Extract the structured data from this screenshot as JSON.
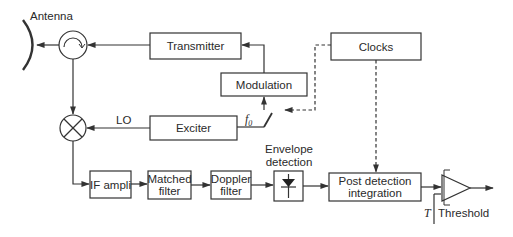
{
  "diagram": {
    "type": "block-diagram",
    "labels": {
      "antenna": "Antenna",
      "lo": "LO",
      "f0_base": "f",
      "f0_sub": "0",
      "envelope_line1": "Envelope",
      "envelope_line2": "detection",
      "threshold_T": "T",
      "threshold": "Threshold"
    },
    "blocks": {
      "transmitter": "Transmitter",
      "modulation": "Modulation",
      "clocks": "Clocks",
      "exciter": "Exciter",
      "if_ampli": "IF ampli",
      "matched_filter_1": "Matched",
      "matched_filter_2": "filter",
      "doppler_filter_1": "Doppler",
      "doppler_filter_2": "filter",
      "post_detection_1": "Post detection",
      "post_detection_2": "integration"
    },
    "nodes": [
      "Antenna",
      "Circulator",
      "Transmitter",
      "Modulation",
      "Clocks",
      "Switch f0",
      "Exciter",
      "Mixer",
      "IF ampli",
      "Matched filter",
      "Doppler filter",
      "Envelope detection",
      "Post detection integration",
      "Threshold comparator"
    ],
    "edges": [
      {
        "from": "Transmitter",
        "to": "Circulator",
        "style": "solid"
      },
      {
        "from": "Circulator",
        "to": "Antenna",
        "style": "solid"
      },
      {
        "from": "Modulation",
        "to": "Transmitter",
        "style": "solid"
      },
      {
        "from": "Clocks",
        "to": "Switch f0",
        "style": "dashed"
      },
      {
        "from": "Switch f0",
        "to": "Modulation",
        "style": "solid"
      },
      {
        "from": "Exciter",
        "to": "Switch f0",
        "style": "solid",
        "label": "f0"
      },
      {
        "from": "Exciter",
        "to": "Mixer",
        "style": "solid",
        "label": "LO"
      },
      {
        "from": "Circulator",
        "to": "Mixer",
        "style": "solid"
      },
      {
        "from": "Mixer",
        "to": "IF ampli",
        "style": "solid"
      },
      {
        "from": "IF ampli",
        "to": "Matched filter",
        "style": "solid"
      },
      {
        "from": "Matched filter",
        "to": "Doppler filter",
        "style": "solid"
      },
      {
        "from": "Doppler filter",
        "to": "Envelope detection",
        "style": "solid"
      },
      {
        "from": "Envelope detection",
        "to": "Post detection integration",
        "style": "solid"
      },
      {
        "from": "Clocks",
        "to": "Post detection integration",
        "style": "dashed"
      },
      {
        "from": "Post detection integration",
        "to": "Threshold comparator",
        "style": "solid"
      },
      {
        "from": "Threshold",
        "to": "Threshold comparator",
        "style": "solid",
        "label": "T"
      }
    ]
  }
}
